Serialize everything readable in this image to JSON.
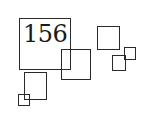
{
  "figure": {
    "label": "156",
    "squares": [
      {
        "id": "square-large-labeled",
        "x": 19,
        "y": 18,
        "w": 52,
        "h": 52
      },
      {
        "id": "square-medium-center",
        "x": 61,
        "y": 49,
        "w": 30,
        "h": 31
      },
      {
        "id": "square-medium-right",
        "x": 97,
        "y": 26,
        "w": 23,
        "h": 24
      },
      {
        "id": "square-small-right-lower",
        "x": 112,
        "y": 55,
        "w": 14,
        "h": 16
      },
      {
        "id": "square-small-right-upper",
        "x": 124,
        "y": 47,
        "w": 12,
        "h": 13
      },
      {
        "id": "square-medium-lower-left",
        "x": 24,
        "y": 72,
        "w": 23,
        "h": 28
      },
      {
        "id": "square-small-lower-left",
        "x": 18,
        "y": 94,
        "w": 12,
        "h": 12
      }
    ],
    "stroke_color": "#2a2a2a",
    "background_color": "#ffffff"
  }
}
